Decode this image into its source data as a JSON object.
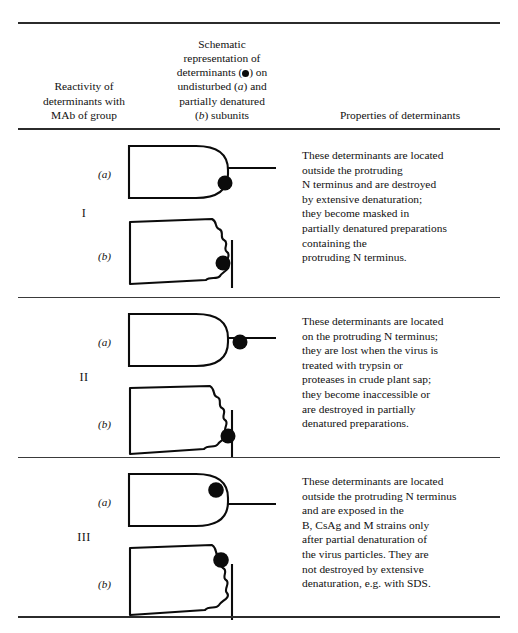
{
  "table": {
    "headers": {
      "col1": {
        "lines": [
          "Reactivity of",
          "determinants with",
          "MAb of group"
        ]
      },
      "col2": {
        "line1": "Schematic",
        "line2": "representation of",
        "line3_pre": "determinants (",
        "line3_post": ") on",
        "line4_pre": "undisturbed (",
        "line4_italic": "a",
        "line4_post": ") and",
        "line5": "partially denatured",
        "line6_pre": "(",
        "line6_italic": "b",
        "line6_post": ") subunits"
      },
      "col3": {
        "label": "Properties of determinants"
      }
    },
    "sublabel_a": "(a)",
    "sublabel_b": "(b)",
    "rows": [
      {
        "group": "I",
        "dot_position_a": "below-right-edge-of-body",
        "dot_position_b": "on-wavy-edge-lower",
        "properties": [
          "These determinants are located",
          "outside the protruding",
          "N terminus and are destroyed",
          "by extensive denaturation;",
          "they become masked in",
          "partially denatured preparations",
          "containing the",
          "protruding N terminus."
        ]
      },
      {
        "group": "II",
        "dot_position_a": "on-protruding-line",
        "dot_position_b": "on-vertical-line-lower",
        "properties": [
          "These determinants are located",
          "on the protruding N terminus;",
          "they are lost when the virus is",
          "treated with trypsin or",
          "proteases in crude plant sap;",
          "they become inaccessible or",
          "are destroyed in partially",
          "denatured preparations."
        ]
      },
      {
        "group": "III",
        "dot_position_a": "above-protruding-line",
        "dot_position_b": "on-wavy-edge-upper",
        "properties": [
          "These determinants are located",
          "outside the protruding N terminus",
          "and are exposed in the",
          "B, CsAg and M strains only",
          "after partial denaturation of",
          "the virus particles. They are",
          "not destroyed by extensive",
          "denaturation, e.g. with SDS."
        ]
      }
    ],
    "colors": {
      "ink": "#111111",
      "rule": "#2b2b2b",
      "determinant_dot": "#0b0b0b"
    }
  }
}
